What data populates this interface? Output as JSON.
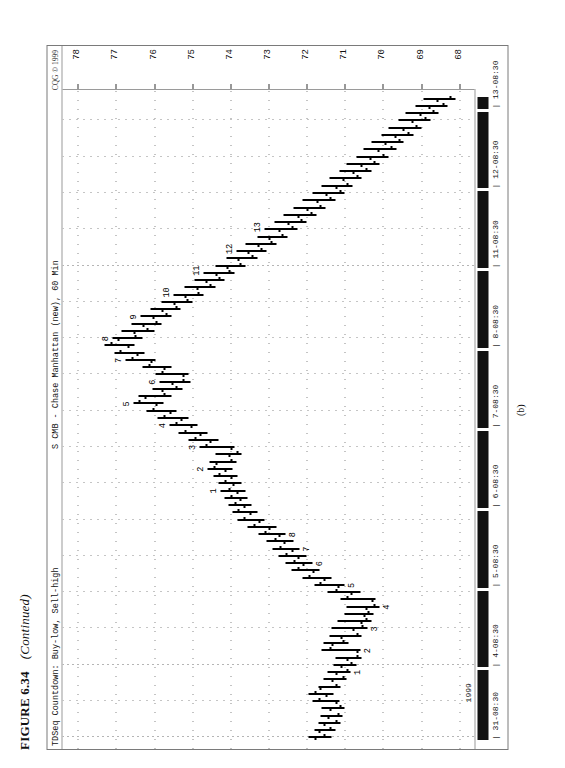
{
  "figure": {
    "number": "FIGURE 6.34",
    "continued": "(Continued)",
    "subfigure_label": "(b)"
  },
  "chart_header": {
    "left": "TDSeq   Countdown: Buy-low, Sell-high",
    "middle": "S CMB - Chase Manhattan (new), 60 Min",
    "copyright": "CQG © 1999"
  },
  "axes": {
    "year": "1999",
    "price_ticks": [
      "78",
      "77",
      "76",
      "75",
      "74",
      "73",
      "72",
      "71",
      "70",
      "69",
      "68"
    ],
    "time_ticks": [
      "31-08:30",
      "4-08:30",
      "5-08:30",
      "6-08:30",
      "7-08:30",
      "8-08:30",
      "11-08:30",
      "12-08:30",
      "13-08:30"
    ]
  },
  "chart_data": {
    "type": "bar",
    "subtype": "ohlc-bar",
    "title": "S CMB - Chase Manhattan (new), 60 Min",
    "subtitle": "TDSeq   Countdown: Buy-low, Sell-high",
    "xlabel": "1999",
    "ylabel": "Price",
    "ylim": [
      67.6,
      78.4
    ],
    "grid": true,
    "legend": "none",
    "x_tick_labels": [
      "31-08:30",
      "4-08:30",
      "5-08:30",
      "6-08:30",
      "7-08:30",
      "8-08:30",
      "11-08:30",
      "12-08:30",
      "13-08:30"
    ],
    "y_tick_labels": [
      "78",
      "77",
      "76",
      "75",
      "74",
      "73",
      "72",
      "71",
      "70",
      "69",
      "68"
    ],
    "annotations_buy_countdown": [
      "1",
      "2",
      "3",
      "4",
      "5",
      "6",
      "7",
      "8"
    ],
    "annotations_sell_countdown": [
      "1",
      "2",
      "3",
      "4",
      "5",
      "6",
      "7",
      "8",
      "9",
      "10",
      "11",
      "12",
      "13"
    ],
    "bars": [
      {
        "i": 0,
        "high": 71.95,
        "low": 71.35,
        "open": 71.8,
        "close": 71.55
      },
      {
        "i": 1,
        "high": 71.8,
        "low": 71.25,
        "open": 71.7,
        "close": 71.4
      },
      {
        "i": 2,
        "high": 71.7,
        "low": 71.1,
        "open": 71.55,
        "close": 71.25
      },
      {
        "i": 3,
        "high": 71.65,
        "low": 71.05,
        "open": 71.45,
        "close": 71.2
      },
      {
        "i": 4,
        "high": 71.6,
        "low": 71.0,
        "open": 71.4,
        "close": 71.15
      },
      {
        "i": 5,
        "high": 71.85,
        "low": 71.15,
        "open": 71.25,
        "close": 71.7
      },
      {
        "i": 6,
        "high": 71.95,
        "low": 71.3,
        "open": 71.5,
        "close": 71.8
      },
      {
        "i": 7,
        "high": 71.7,
        "low": 71.1,
        "open": 71.65,
        "close": 71.25
      },
      {
        "i": 8,
        "high": 71.55,
        "low": 70.95,
        "open": 71.35,
        "close": 71.05
      },
      {
        "i": 9,
        "high": 71.45,
        "low": 70.85,
        "open": 71.25,
        "close": 70.95
      },
      {
        "i": 10,
        "high": 71.3,
        "low": 70.7,
        "open": 71.1,
        "close": 70.85
      },
      {
        "i": 11,
        "high": 71.25,
        "low": 70.55,
        "open": 70.95,
        "close": 70.7
      },
      {
        "i": 12,
        "high": 71.6,
        "low": 70.6,
        "open": 70.7,
        "close": 71.4
      },
      {
        "i": 13,
        "high": 71.55,
        "low": 70.9,
        "open": 71.35,
        "close": 71.05
      },
      {
        "i": 14,
        "high": 71.4,
        "low": 70.55,
        "open": 71.1,
        "close": 70.7
      },
      {
        "i": 15,
        "high": 71.35,
        "low": 70.4,
        "open": 70.8,
        "close": 70.55
      },
      {
        "i": 16,
        "high": 71.2,
        "low": 70.3,
        "open": 70.6,
        "close": 70.45
      },
      {
        "i": 17,
        "high": 71.0,
        "low": 70.25,
        "open": 70.5,
        "close": 70.4
      },
      {
        "i": 18,
        "high": 70.95,
        "low": 70.1,
        "open": 70.45,
        "close": 70.25
      },
      {
        "i": 19,
        "high": 71.1,
        "low": 70.2,
        "open": 70.3,
        "close": 70.95
      },
      {
        "i": 20,
        "high": 71.45,
        "low": 70.6,
        "open": 70.85,
        "close": 71.25
      },
      {
        "i": 21,
        "high": 71.8,
        "low": 71.0,
        "open": 71.2,
        "close": 71.65
      },
      {
        "i": 22,
        "high": 72.1,
        "low": 71.35,
        "open": 71.55,
        "close": 71.95
      },
      {
        "i": 23,
        "high": 72.4,
        "low": 71.65,
        "open": 71.85,
        "close": 72.25
      },
      {
        "i": 24,
        "high": 72.55,
        "low": 71.85,
        "open": 72.1,
        "close": 72.35
      },
      {
        "i": 25,
        "high": 72.75,
        "low": 72.0,
        "open": 72.25,
        "close": 72.55
      },
      {
        "i": 26,
        "high": 72.9,
        "low": 72.2,
        "open": 72.4,
        "close": 72.7
      },
      {
        "i": 27,
        "high": 73.05,
        "low": 72.35,
        "open": 72.6,
        "close": 72.85
      },
      {
        "i": 28,
        "high": 73.25,
        "low": 72.55,
        "open": 72.75,
        "close": 73.1
      },
      {
        "i": 29,
        "high": 73.55,
        "low": 72.8,
        "open": 73.0,
        "close": 73.4
      },
      {
        "i": 30,
        "high": 73.8,
        "low": 73.1,
        "open": 73.25,
        "close": 73.65
      },
      {
        "i": 31,
        "high": 73.95,
        "low": 73.3,
        "open": 73.5,
        "close": 73.8
      },
      {
        "i": 32,
        "high": 74.05,
        "low": 73.45,
        "open": 73.65,
        "close": 73.9
      },
      {
        "i": 33,
        "high": 74.15,
        "low": 73.55,
        "open": 73.75,
        "close": 74.0
      },
      {
        "i": 34,
        "high": 74.25,
        "low": 73.6,
        "open": 73.85,
        "close": 74.05
      },
      {
        "i": 35,
        "high": 74.3,
        "low": 73.7,
        "open": 73.95,
        "close": 74.15
      },
      {
        "i": 36,
        "high": 74.45,
        "low": 73.8,
        "open": 74.0,
        "close": 74.3
      },
      {
        "i": 37,
        "high": 74.6,
        "low": 73.95,
        "open": 74.15,
        "close": 74.45
      },
      {
        "i": 38,
        "high": 74.55,
        "low": 73.85,
        "open": 74.4,
        "close": 74.0
      },
      {
        "i": 39,
        "high": 74.4,
        "low": 73.7,
        "open": 74.05,
        "close": 73.85
      },
      {
        "i": 40,
        "high": 74.8,
        "low": 73.9,
        "open": 74.0,
        "close": 74.65
      },
      {
        "i": 41,
        "high": 75.1,
        "low": 74.3,
        "open": 74.55,
        "close": 74.95
      },
      {
        "i": 42,
        "high": 75.35,
        "low": 74.6,
        "open": 74.8,
        "close": 75.2
      },
      {
        "i": 43,
        "high": 75.6,
        "low": 74.85,
        "open": 75.05,
        "close": 75.45
      },
      {
        "i": 44,
        "high": 75.9,
        "low": 75.1,
        "open": 75.3,
        "close": 75.75
      },
      {
        "i": 45,
        "high": 76.2,
        "low": 75.4,
        "open": 75.6,
        "close": 76.05
      },
      {
        "i": 46,
        "high": 76.55,
        "low": 75.75,
        "open": 75.95,
        "close": 76.4
      },
      {
        "i": 47,
        "high": 76.4,
        "low": 75.55,
        "open": 76.25,
        "close": 75.75
      },
      {
        "i": 48,
        "high": 76.05,
        "low": 75.25,
        "open": 75.8,
        "close": 75.45
      },
      {
        "i": 49,
        "high": 75.85,
        "low": 75.05,
        "open": 75.55,
        "close": 75.25
      },
      {
        "i": 50,
        "high": 75.95,
        "low": 75.1,
        "open": 75.25,
        "close": 75.8
      },
      {
        "i": 51,
        "high": 76.3,
        "low": 75.55,
        "open": 75.75,
        "close": 76.15
      },
      {
        "i": 52,
        "high": 76.75,
        "low": 75.95,
        "open": 76.1,
        "close": 76.6
      },
      {
        "i": 53,
        "high": 77.05,
        "low": 76.25,
        "open": 76.45,
        "close": 76.9
      },
      {
        "i": 54,
        "high": 77.3,
        "low": 76.5,
        "open": 76.7,
        "close": 77.15
      },
      {
        "i": 55,
        "high": 77.1,
        "low": 76.3,
        "open": 76.95,
        "close": 76.5
      },
      {
        "i": 56,
        "high": 76.85,
        "low": 76.0,
        "open": 76.55,
        "close": 76.2
      },
      {
        "i": 57,
        "high": 76.6,
        "low": 75.8,
        "open": 76.3,
        "close": 75.95
      },
      {
        "i": 58,
        "high": 76.35,
        "low": 75.55,
        "open": 76.05,
        "close": 75.7
      },
      {
        "i": 59,
        "high": 76.1,
        "low": 75.3,
        "open": 75.8,
        "close": 75.45
      },
      {
        "i": 60,
        "high": 75.8,
        "low": 75.0,
        "open": 75.5,
        "close": 75.15
      },
      {
        "i": 61,
        "high": 75.5,
        "low": 74.7,
        "open": 75.2,
        "close": 74.85
      },
      {
        "i": 62,
        "high": 75.2,
        "low": 74.4,
        "open": 74.9,
        "close": 74.55
      },
      {
        "i": 63,
        "high": 74.95,
        "low": 74.15,
        "open": 74.65,
        "close": 74.3
      },
      {
        "i": 64,
        "high": 74.7,
        "low": 73.9,
        "open": 74.4,
        "close": 74.05
      },
      {
        "i": 65,
        "high": 74.4,
        "low": 73.6,
        "open": 74.1,
        "close": 73.75
      },
      {
        "i": 66,
        "high": 74.1,
        "low": 73.3,
        "open": 73.8,
        "close": 73.45
      },
      {
        "i": 67,
        "high": 73.85,
        "low": 73.05,
        "open": 73.55,
        "close": 73.2
      },
      {
        "i": 68,
        "high": 73.6,
        "low": 72.8,
        "open": 73.3,
        "close": 72.95
      },
      {
        "i": 69,
        "high": 73.3,
        "low": 72.5,
        "open": 73.0,
        "close": 72.65
      },
      {
        "i": 70,
        "high": 73.1,
        "low": 72.25,
        "open": 72.75,
        "close": 72.4
      },
      {
        "i": 71,
        "high": 72.85,
        "low": 72.0,
        "open": 72.5,
        "close": 72.15
      },
      {
        "i": 72,
        "high": 72.6,
        "low": 71.75,
        "open": 72.25,
        "close": 71.9
      },
      {
        "i": 73,
        "high": 72.35,
        "low": 71.5,
        "open": 72.0,
        "close": 71.65
      },
      {
        "i": 74,
        "high": 72.1,
        "low": 71.25,
        "open": 71.75,
        "close": 71.4
      },
      {
        "i": 75,
        "high": 71.85,
        "low": 71.0,
        "open": 71.5,
        "close": 71.15
      },
      {
        "i": 76,
        "high": 71.6,
        "low": 70.8,
        "open": 71.25,
        "close": 70.95
      },
      {
        "i": 77,
        "high": 71.4,
        "low": 70.55,
        "open": 71.05,
        "close": 70.7
      },
      {
        "i": 78,
        "high": 71.15,
        "low": 70.3,
        "open": 70.8,
        "close": 70.45
      },
      {
        "i": 79,
        "high": 70.95,
        "low": 70.1,
        "open": 70.6,
        "close": 70.25
      },
      {
        "i": 80,
        "high": 70.7,
        "low": 69.85,
        "open": 70.35,
        "close": 70.0
      },
      {
        "i": 81,
        "high": 70.5,
        "low": 69.65,
        "open": 70.15,
        "close": 69.8
      },
      {
        "i": 82,
        "high": 70.3,
        "low": 69.45,
        "open": 69.95,
        "close": 69.6
      },
      {
        "i": 83,
        "high": 70.05,
        "low": 69.2,
        "open": 69.7,
        "close": 69.35
      },
      {
        "i": 84,
        "high": 69.85,
        "low": 69.0,
        "open": 69.5,
        "close": 69.15
      },
      {
        "i": 85,
        "high": 69.6,
        "low": 68.75,
        "open": 69.25,
        "close": 68.9
      },
      {
        "i": 86,
        "high": 69.4,
        "low": 68.55,
        "open": 69.05,
        "close": 68.7
      },
      {
        "i": 87,
        "high": 69.15,
        "low": 68.3,
        "open": 68.8,
        "close": 68.45
      },
      {
        "i": 88,
        "high": 68.95,
        "low": 68.1,
        "open": 68.6,
        "close": 68.25
      }
    ]
  }
}
